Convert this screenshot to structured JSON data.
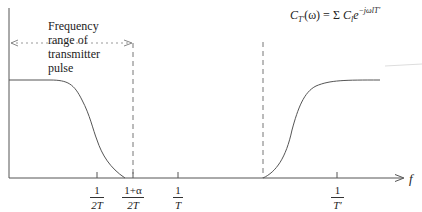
{
  "diagram": {
    "annotation": {
      "lines": [
        "Frequency",
        "range of",
        "transmitter",
        "pulse"
      ]
    },
    "formula": {
      "lhs_symbol": "C",
      "lhs_subscript": "T′",
      "lhs_arg": "(ω) = Σ ",
      "rhs_symbol": "C",
      "rhs_subscript": "l",
      "rhs_base": "e",
      "rhs_exponent": "−jωlT′"
    },
    "x_axis": {
      "label": "f",
      "ticks": [
        {
          "num": "1",
          "den": "2T"
        },
        {
          "num": "1+α",
          "den": "2T"
        },
        {
          "num": "1",
          "den": "T"
        },
        {
          "num": "1",
          "den": "T′"
        }
      ]
    },
    "colors": {
      "stroke": "#444444",
      "dashed": "#777777",
      "dotted": "#999999",
      "background": "#ffffff"
    }
  }
}
